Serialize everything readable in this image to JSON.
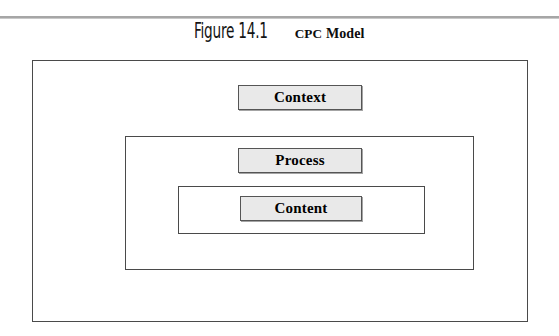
{
  "figure": {
    "rule_color": "#a6a6a6",
    "caption": {
      "number": "Figure 14.1",
      "title_abbrev": "CPC",
      "title_rest": " Model"
    },
    "frames": [
      {
        "id": "context-frame",
        "label": "Context"
      },
      {
        "id": "process-frame",
        "label": "Process"
      },
      {
        "id": "content-frame",
        "label": "Content"
      }
    ],
    "labels": {
      "context": "Context",
      "process": "Process",
      "content": "Content"
    },
    "colors": {
      "label_fill": "#e9e9e9",
      "label_border": "#555555",
      "frame_border": "#4a4a4a",
      "text": "#000000",
      "page_background": "#ffffff"
    }
  }
}
